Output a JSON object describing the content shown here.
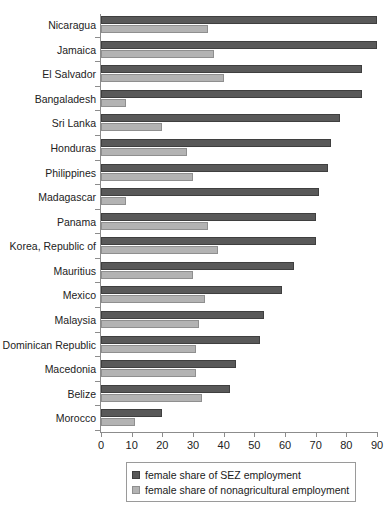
{
  "chart_data": {
    "type": "bar",
    "orientation": "horizontal",
    "title": "",
    "subtitle": "",
    "xlabel": "",
    "ylabel": "",
    "xlim": [
      0,
      90
    ],
    "xticks": [
      0,
      10,
      20,
      30,
      40,
      50,
      60,
      70,
      80,
      90
    ],
    "grid": false,
    "legend_position": "bottom",
    "categories": [
      "Nicaragua",
      "Jamaica",
      "El Salvador",
      "Bangaladesh",
      "Sri Lanka",
      "Honduras",
      "Philippines",
      "Madagascar",
      "Panama",
      "Korea, Republic of",
      "Mauritius",
      "Mexico",
      "Malaysia",
      "Dominican Republic",
      "Macedonia",
      "Belize",
      "Morocco"
    ],
    "series": [
      {
        "name": "female share of SEZ employment",
        "color": "#595959",
        "values": [
          90,
          90,
          85,
          85,
          78,
          75,
          74,
          71,
          70,
          70,
          63,
          59,
          53,
          52,
          44,
          42,
          20
        ]
      },
      {
        "name": "female share of nonagricultural employment",
        "color": "#b3b3b3",
        "values": [
          35,
          37,
          40,
          8,
          20,
          28,
          30,
          8,
          35,
          38,
          30,
          34,
          32,
          31,
          31,
          33,
          11
        ]
      }
    ]
  },
  "legend": {
    "items": [
      {
        "label": "female share of SEZ employment",
        "swatch": "sez"
      },
      {
        "label": "female share of nonagricultural employment",
        "swatch": "nonag"
      }
    ]
  }
}
